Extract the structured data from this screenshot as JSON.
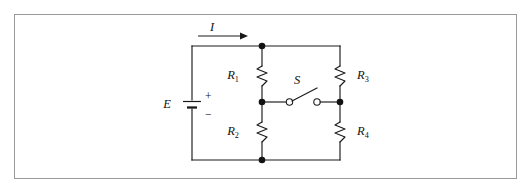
{
  "figure": {
    "kind": "circuit-diagram",
    "title": "",
    "background_color": "#ffffff",
    "frame_border_color": "#9a9a9a",
    "wire_color": "#1a1a1a"
  },
  "labels": {
    "current": "I",
    "emf": "E",
    "plus": "+",
    "minus": "−",
    "switch": "S",
    "r1_base": "R",
    "r1_sub": "1",
    "r2_base": "R",
    "r2_sub": "2",
    "r3_base": "R",
    "r3_sub": "3",
    "r4_base": "R",
    "r4_sub": "4"
  },
  "components": [
    {
      "id": "source",
      "name": "battery",
      "label": "E",
      "polarity_top": "+",
      "polarity_bottom": "−"
    },
    {
      "id": "r1",
      "name": "resistor",
      "label": "R1"
    },
    {
      "id": "r2",
      "name": "resistor",
      "label": "R2"
    },
    {
      "id": "r3",
      "name": "resistor",
      "label": "R3"
    },
    {
      "id": "r4",
      "name": "resistor",
      "label": "R4"
    },
    {
      "id": "s1",
      "name": "switch",
      "label": "S",
      "state": "open"
    }
  ],
  "nodes": [
    {
      "id": "top-middle",
      "type": "junction"
    },
    {
      "id": "mid-left",
      "type": "junction"
    },
    {
      "id": "mid-right",
      "type": "junction"
    },
    {
      "id": "bottom-middle",
      "type": "junction"
    }
  ]
}
